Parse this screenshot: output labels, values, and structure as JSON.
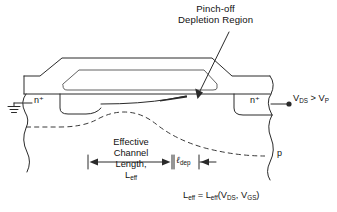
{
  "figure": {
    "type": "device-cross-section-diagram",
    "background_color": "#ffffff",
    "line_color": "#2a2a2a"
  },
  "title": {
    "line1": "Pinch-off",
    "line2": "Depletion Region"
  },
  "labels": {
    "n_plus_left": "n⁺",
    "n_plus_right": "n⁺",
    "p_substrate": "p",
    "bias": "V DS > V P",
    "bias_main": "V",
    "bias_sub1": "DS",
    "bias_rel": " > V",
    "bias_sub2": "P",
    "effective_line1": "Effective",
    "effective_line2": "Channel",
    "effective_line3": "Length,",
    "effective_line4": "L",
    "effective_line4_sub": "eff",
    "l_dep_symbol": "ℓ",
    "l_dep_sub": "dep"
  },
  "equation": {
    "lhs": "L",
    "lhs_sub": "eff",
    "eq": " = L",
    "rhs_sub": "eff",
    "rhs_open": "(V",
    "rhs_sub1": "DS",
    "rhs_comma": ",  V",
    "rhs_sub2": "GS",
    "rhs_close": ")",
    "full": "L_eff = L_eff(V_DS, V_GS)"
  },
  "annotations": {
    "pointer_arrow": "arrow from title down-left into pinch-off region",
    "ground_symbol": "earth ground at source terminal",
    "drain_terminal_dot": "filled circle terminal at drain"
  }
}
